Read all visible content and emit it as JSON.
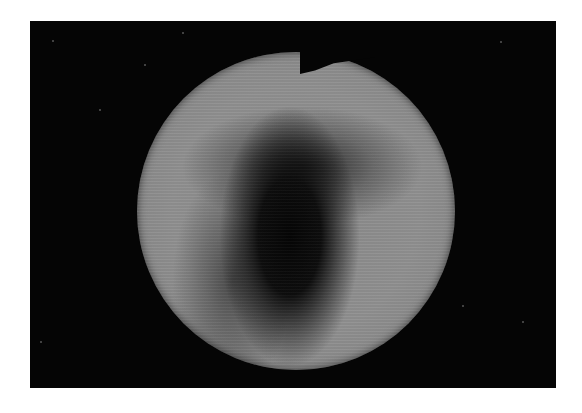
{
  "image": {
    "description": "Grayscale circular field photograph on black background",
    "subject": "circular-field-image",
    "colors": {
      "page_background": "#ffffff",
      "frame_background": "#050505",
      "disc_gray": "#8c8c8c",
      "dark_region": "#050505"
    }
  }
}
